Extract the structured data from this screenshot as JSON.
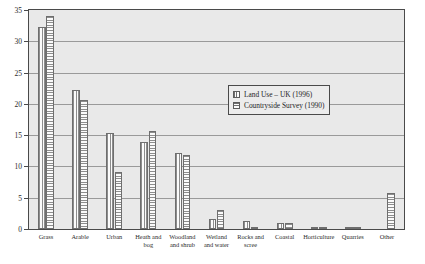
{
  "chart_data": {
    "type": "bar",
    "title": "",
    "xlabel": "",
    "ylabel": "",
    "ylim": [
      0,
      35
    ],
    "ytick_step": 5,
    "yticks": [
      "0",
      "5",
      "10",
      "15",
      "20",
      "25",
      "30",
      "35"
    ],
    "grid": true,
    "legend_position": "inside-upper-right",
    "categories": [
      "Grass",
      "Arable",
      "Urban",
      "Heath and bog",
      "Woodland and shrub",
      "Wetland and water",
      "Rocks and scree",
      "Coastal",
      "Horticulture",
      "Quarries",
      "Other"
    ],
    "category_lines": [
      [
        "Grass"
      ],
      [
        "Arable"
      ],
      [
        "Urban"
      ],
      [
        "Heath and",
        "bog"
      ],
      [
        "Woodland",
        "and shrub"
      ],
      [
        "Wetland",
        "and water"
      ],
      [
        "Rocks and",
        "scree"
      ],
      [
        "Coastal"
      ],
      [
        "Horticulture"
      ],
      [
        "Quarries"
      ],
      [
        "Other"
      ]
    ],
    "series": [
      {
        "name": "Land Use – UK (1996)",
        "pattern": "vertical-stripes",
        "values": [
          32.3,
          22.2,
          15.3,
          13.9,
          12.2,
          1.6,
          1.3,
          0.9,
          0.4,
          0.1,
          0
        ]
      },
      {
        "name": "Countryside Survey (1990)",
        "pattern": "horizontal-stripes",
        "values": [
          34.0,
          20.6,
          9.1,
          15.7,
          11.9,
          3.0,
          0.2,
          0.9,
          0.3,
          0.1,
          5.7
        ]
      }
    ]
  },
  "legend": {
    "entries": [
      {
        "label": "Land Use – UK (1996)"
      },
      {
        "label": "Countryside Survey (1990)"
      }
    ]
  },
  "colors": {
    "plot_background": "#e9e9e9",
    "axis_line": "#4a4a4a",
    "gridline": "#9a9a9a",
    "bar_outline": "#6e6e6e",
    "text": "#2b2b2b",
    "page_background": "#ffffff"
  }
}
